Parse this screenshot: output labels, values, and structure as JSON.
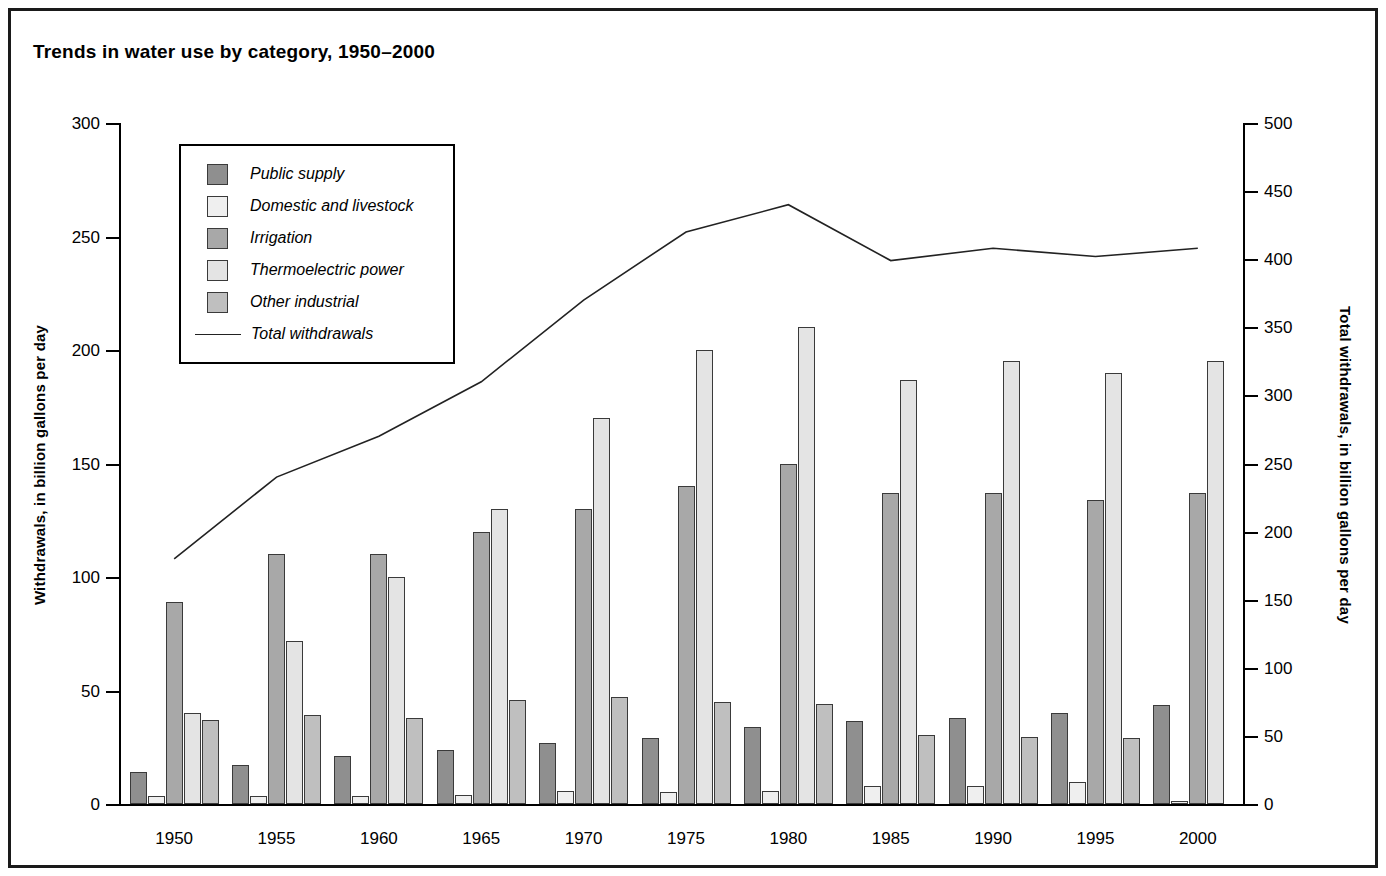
{
  "figure": {
    "title": "Trends in water use by category, 1950–2000",
    "border_color": "#1a1a1a"
  },
  "axes": {
    "left": {
      "title": "Withdrawals, in billion gallons per day",
      "ticks": [
        "0",
        "50",
        "100",
        "150",
        "200",
        "250",
        "300"
      ],
      "min": 0,
      "max": 300,
      "step": 50
    },
    "right": {
      "title": "Total withdrawals, in billion gallons per day",
      "ticks": [
        "0",
        "50",
        "100",
        "150",
        "200",
        "250",
        "300",
        "350",
        "400",
        "450",
        "500"
      ],
      "min": 0,
      "max": 500,
      "step": 50
    },
    "x": {
      "ticks": [
        "1950",
        "1955",
        "1960",
        "1965",
        "1970",
        "1975",
        "1980",
        "1985",
        "1990",
        "1995",
        "2000"
      ]
    }
  },
  "legend": {
    "items": [
      {
        "label": "Public supply",
        "swatch": "#8f8f8f",
        "type": "bar"
      },
      {
        "label": "Domestic and livestock",
        "swatch": "#efefef",
        "type": "bar"
      },
      {
        "label": "Irrigation",
        "swatch": "#a8a8a8",
        "type": "bar"
      },
      {
        "label": "Thermoelectric power",
        "swatch": "#e4e4e4",
        "type": "bar"
      },
      {
        "label": "Other industrial",
        "swatch": "#bfbfbf",
        "type": "bar"
      },
      {
        "label": "Total withdrawals",
        "swatch": "#222222",
        "type": "line"
      }
    ]
  },
  "chart_data": {
    "type": "bar",
    "title": "Trends in water use by category, 1950–2000",
    "xlabel": "",
    "ylabel": "Withdrawals, in billion gallons per day",
    "y2label": "Total withdrawals, in billion gallons per day",
    "ylim": [
      0,
      300
    ],
    "y2lim": [
      0,
      500
    ],
    "grid": false,
    "legend_position": "upper-left-inside",
    "categories": [
      "1950",
      "1955",
      "1960",
      "1965",
      "1970",
      "1975",
      "1980",
      "1985",
      "1990",
      "1995",
      "2000"
    ],
    "series": [
      {
        "name": "Public supply",
        "color": "#8f8f8f",
        "axis": "left",
        "values": [
          14,
          17,
          21,
          24,
          27,
          29,
          34,
          36.5,
          38,
          40,
          43.5
        ]
      },
      {
        "name": "Domestic and livestock",
        "color": "#efefef",
        "axis": "left",
        "values": [
          3.6,
          3.6,
          3.6,
          4,
          5.6,
          5.1,
          5.6,
          7.8,
          8.0,
          9.5,
          1.5
        ]
      },
      {
        "name": "Irrigation",
        "color": "#a8a8a8",
        "axis": "left",
        "values": [
          89,
          110,
          110,
          120,
          130,
          140,
          150,
          137,
          137,
          134,
          137
        ]
      },
      {
        "name": "Thermoelectric power",
        "color": "#e4e4e4",
        "axis": "left",
        "values": [
          40,
          72,
          100,
          130,
          170,
          200,
          210,
          187,
          195,
          190,
          195
        ]
      },
      {
        "name": "Other industrial",
        "color": "#bfbfbf",
        "axis": "left",
        "values": [
          37,
          39,
          38,
          46,
          47,
          45,
          44,
          30.5,
          29.5,
          29,
          null
        ]
      }
    ],
    "line_series": {
      "name": "Total withdrawals",
      "color": "#222222",
      "axis": "right",
      "values": [
        180,
        240,
        270,
        310,
        370,
        420,
        440,
        399,
        408,
        402,
        408
      ]
    }
  }
}
